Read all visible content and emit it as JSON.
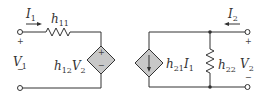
{
  "diagram": {
    "title": "",
    "type": "h-parameter two-port equivalent circuit",
    "colors": {
      "wire": "#333333",
      "source_fill": "#c8c8c8"
    },
    "input_port": {
      "current": {
        "symbol": "I",
        "sub": "1"
      },
      "voltage": {
        "symbol": "V",
        "sub": "1"
      },
      "plus": "+",
      "minus": "−",
      "resistor": {
        "symbol": "h",
        "sub": "11"
      },
      "dependent_source": {
        "kind": "voltage",
        "coef": "h",
        "coef_sub": "12",
        "var": "V",
        "var_sub": "2",
        "plus": "+",
        "minus": "−"
      }
    },
    "output_port": {
      "current": {
        "symbol": "I",
        "sub": "2"
      },
      "voltage": {
        "symbol": "V",
        "sub": "2"
      },
      "plus": "+",
      "minus": "−",
      "resistor": {
        "symbol": "h",
        "sub": "22"
      },
      "dependent_source": {
        "kind": "current",
        "coef": "h",
        "coef_sub": "21",
        "var": "I",
        "var_sub": "1"
      }
    }
  }
}
